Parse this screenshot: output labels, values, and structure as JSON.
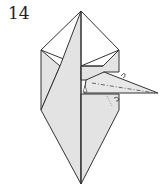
{
  "diagram": {
    "step_number": "14",
    "colors": {
      "paper_shaded": "#e3e3e3",
      "paper_white": "#ffffff",
      "line": "#333333"
    },
    "annotations": [
      "valley-fold dash-dot line on beak flap",
      "small arrows indicating fold",
      "reverse fold on right flap"
    ]
  }
}
